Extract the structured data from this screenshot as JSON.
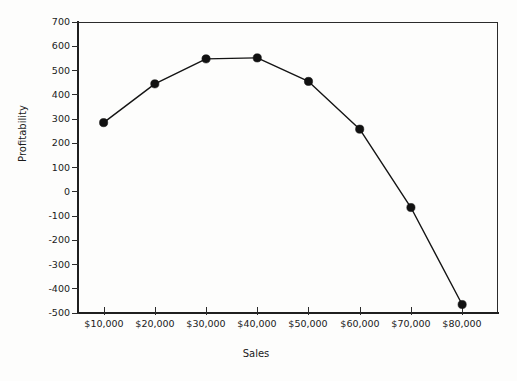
{
  "figure": {
    "background_color": "#fdfdfc",
    "ink_color": "#1a1a1a",
    "title_remnant": "",
    "frame": {
      "left": 78,
      "top": 22,
      "right": 498,
      "bottom": 313
    }
  },
  "axis_titles": {
    "y": "Profitability",
    "x": "Sales"
  },
  "chart_data": {
    "type": "line",
    "title": "",
    "xlabel": "Sales",
    "ylabel": "Profitability",
    "categories": [
      "$10,000",
      "$20,000",
      "$30,000",
      "$40,000",
      "$50,000",
      "$60,000",
      "$70,000",
      "$80,000"
    ],
    "x": [
      10000,
      20000,
      30000,
      40000,
      50000,
      60000,
      70000,
      80000
    ],
    "values": [
      285,
      445,
      548,
      552,
      455,
      258,
      -65,
      -465
    ],
    "series": [
      {
        "name": "Profitability",
        "values": [
          285,
          445,
          548,
          552,
          455,
          258,
          -65,
          -465
        ],
        "line_color": "#141414",
        "marker": "circle",
        "marker_color": "#111111"
      }
    ],
    "ylim": [
      -500,
      700
    ],
    "ytick_labels": [
      "700",
      "600",
      "500",
      "400",
      "300",
      "200",
      "100",
      "0",
      "-100",
      "-200",
      "-300",
      "-400",
      "-500"
    ],
    "yticks": [
      700,
      600,
      500,
      400,
      300,
      200,
      100,
      0,
      -100,
      -200,
      -300,
      -400,
      -500
    ],
    "xtick_labels": [
      "$10,000",
      "$20,000",
      "$30,000",
      "$40,000",
      "$50,000",
      "$60,000",
      "$70,000",
      "$80,000"
    ],
    "grid": false,
    "legend": false,
    "legend_position": "none"
  }
}
